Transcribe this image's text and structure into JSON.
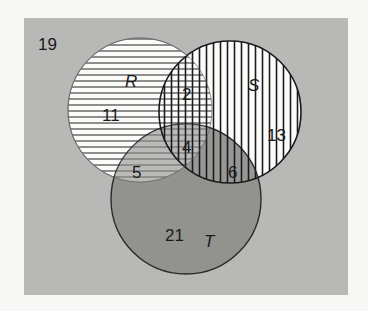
{
  "diagram": {
    "type": "venn-3",
    "universe": {
      "outside_count": "19"
    },
    "sets": [
      {
        "id": "R",
        "label": "R",
        "fill": "horizontal-lines"
      },
      {
        "id": "S",
        "label": "S",
        "fill": "vertical-lines"
      },
      {
        "id": "T",
        "label": "T",
        "fill": "dark-gray"
      }
    ],
    "regions": {
      "R_only": "11",
      "S_only": "13",
      "T_only": "21",
      "R_and_S_only": "2",
      "R_and_T_only": "5",
      "S_and_T_only": "6",
      "R_S_T": "4"
    },
    "colors": {
      "background": "#f7f7f5",
      "universe": "#b8b8b6",
      "circle_fill": "#fbfbfa",
      "T_fill": "#8e8e8c",
      "lines": "#2a2a2a"
    }
  }
}
